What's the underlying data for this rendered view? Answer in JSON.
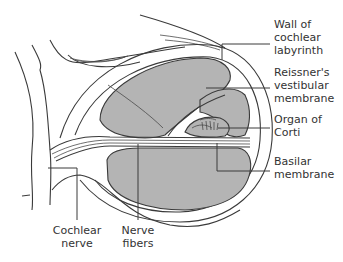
{
  "diagram": {
    "colors": {
      "background": "#ffffff",
      "scala_fill": "#b4b4b4",
      "outline": "#3a3a3a",
      "label_text": "#333333"
    },
    "labels": {
      "wall": [
        "Wall of",
        "cochlear",
        "labyrinth"
      ],
      "reissner": [
        "Reissner's",
        "vestibular",
        "membrane"
      ],
      "corti": [
        "Organ of",
        "Corti"
      ],
      "basilar": [
        "Basilar",
        "membrane"
      ],
      "cochlear_nerve": [
        "Cochlear",
        "nerve"
      ],
      "nerve_fibers": [
        "Nerve",
        "fibers"
      ]
    }
  }
}
